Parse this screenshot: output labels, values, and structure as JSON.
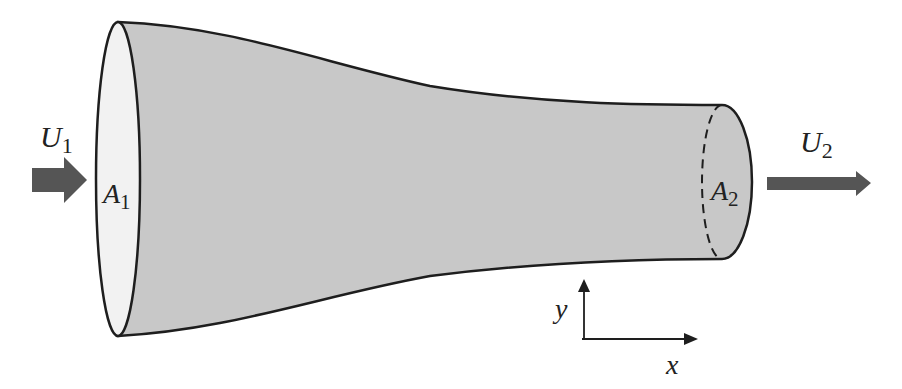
{
  "figure": {
    "labels": {
      "inlet_velocity": {
        "symbol": "U",
        "subscript": "1"
      },
      "inlet_area": {
        "symbol": "A",
        "subscript": "1"
      },
      "outlet_velocity": {
        "symbol": "U",
        "subscript": "2"
      },
      "outlet_area": {
        "symbol": "A",
        "subscript": "2"
      },
      "axis_x": "x",
      "axis_y": "y"
    },
    "colors": {
      "duct_fill": "#c8c8c8",
      "inlet_face_fill": "#f2f2f2",
      "outline": "#1e1e1e",
      "arrow_fill": "#555555"
    }
  }
}
